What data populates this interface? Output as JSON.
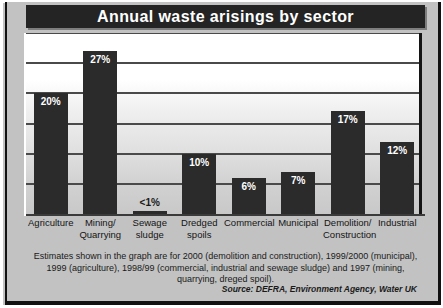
{
  "title": "Annual waste arisings by sector",
  "footnote": "Estimates shown in the graph are for 2000 (demolition and construction), 1999/2000 (municipal), 1999 (agriculture), 1998/99 (commercial, industrial and sewage sludge) and 1997 (mining, quarrying, dreged spoil).",
  "source": "Source: DEFRA, Environment Agency, Water UK",
  "colors": {
    "bar": "#2b2b2b",
    "title_bg": "#242424",
    "title_text": "#ffffff",
    "frame": "#c2c2c2",
    "gridline": "#4a4a4a"
  },
  "chart_data": {
    "type": "bar",
    "title": "Annual waste arisings by sector",
    "xlabel": "",
    "ylabel": "",
    "ylim": [
      0,
      30
    ],
    "grid": true,
    "legend": "none",
    "gridline_values": [
      5,
      10,
      15,
      20,
      25,
      30
    ],
    "categories": [
      "Agriculture",
      "Mining/ Quarrying",
      "Sewage sludge",
      "Dredged spoils",
      "Commercial",
      "Municipal",
      "Demolition/ Construction",
      "Industrial"
    ],
    "category_lines": [
      [
        "Agriculture"
      ],
      [
        "Mining/",
        "Quarrying"
      ],
      [
        "Sewage",
        "sludge"
      ],
      [
        "Dredged",
        "spoils"
      ],
      [
        "Commercial"
      ],
      [
        "Municipal"
      ],
      [
        "Demolition/",
        "Construction"
      ],
      [
        "Industrial"
      ]
    ],
    "values": [
      20,
      27,
      0.5,
      10,
      6,
      7,
      17,
      12
    ],
    "data_labels": [
      "20%",
      "27%",
      "<1%",
      "10%",
      "6%",
      "7%",
      "17%",
      "12%"
    ]
  }
}
